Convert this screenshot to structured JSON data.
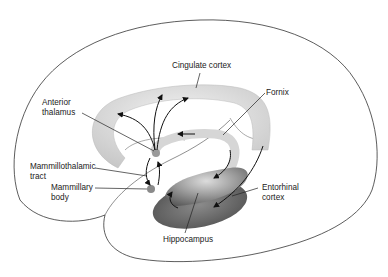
{
  "diagram": {
    "type": "anatomical-diagram",
    "labels": {
      "cingulate_cortex": "Cingulate cortex",
      "fornix": "Fornix",
      "anterior_thalamus": [
        "Anterior",
        "thalamus"
      ],
      "mammillothalamic_tract": [
        "Mammillothalamic",
        "tract"
      ],
      "mammillary_body": [
        "Mammillary",
        "body"
      ],
      "entorhinal_cortex": [
        "Entorhinal",
        "cortex"
      ],
      "hippocampus": "Hippocampus"
    },
    "colors": {
      "outline": "#333333",
      "structure_light": "#e2e2e2",
      "structure_mid": "#b8b8b8",
      "hippocampus_dark": "#6a6a6a",
      "arrows": "#111111"
    }
  }
}
